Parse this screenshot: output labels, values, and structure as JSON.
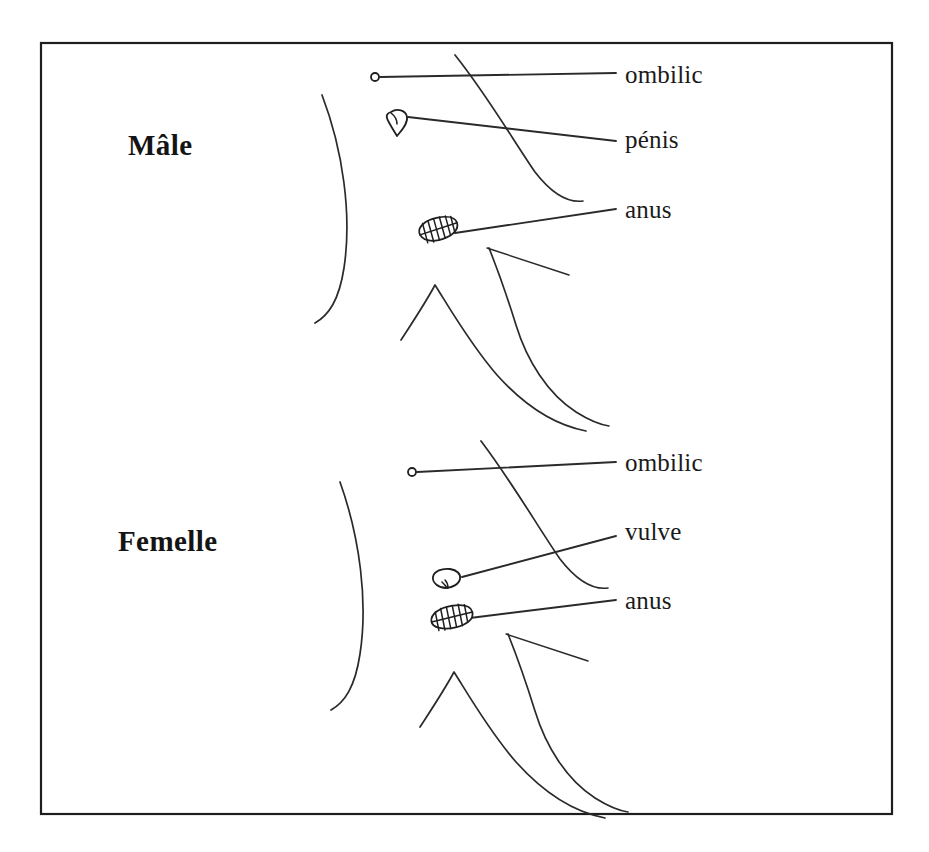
{
  "figure": {
    "kind": "anatomical-line-drawing",
    "language": "fr",
    "background_color": "#ffffff",
    "ink_color": "#2a2a2a",
    "frame": {
      "name": "figure-border",
      "x": 40,
      "y": 42,
      "width": 853,
      "height": 773,
      "stroke_color": "#1e1e1e"
    }
  },
  "panels": [
    {
      "id": "male",
      "title": "Mâle",
      "title_x": 128,
      "title_y": 131,
      "navel_marker": {
        "cx": 375,
        "cy": 77,
        "r": 4
      },
      "labels": [
        {
          "id": "male-ombilic",
          "text": "ombilic",
          "x": 625,
          "y": 62,
          "leader": [
            [
              380,
              77
            ],
            [
              616,
              73
            ]
          ]
        },
        {
          "id": "male-penis",
          "text": "pénis",
          "x": 625,
          "y": 127,
          "leader": [
            [
              408,
              117
            ],
            [
              616,
              141
            ]
          ]
        },
        {
          "id": "male-anus",
          "text": "anus",
          "x": 625,
          "y": 197,
          "leader": [
            [
              455,
              233
            ],
            [
              616,
              209
            ]
          ]
        }
      ],
      "organs": [
        {
          "id": "male-penis-organ",
          "type": "penis",
          "cx": 399,
          "cy": 120
        },
        {
          "id": "male-anus-organ",
          "type": "anus",
          "cx": 438,
          "cy": 229
        }
      ]
    },
    {
      "id": "female",
      "title": "Femelle",
      "title_x": 118,
      "title_y": 527,
      "navel_marker": {
        "cx": 412,
        "cy": 472,
        "r": 4
      },
      "labels": [
        {
          "id": "female-ombilic",
          "text": "ombilic",
          "x": 625,
          "y": 450,
          "leader": [
            [
              417,
              472
            ],
            [
              616,
              462
            ]
          ]
        },
        {
          "id": "female-vulve",
          "text": "vulve",
          "x": 625,
          "y": 519,
          "leader": [
            [
              462,
              577
            ],
            [
              616,
              536
            ]
          ]
        },
        {
          "id": "female-anus",
          "text": "anus",
          "x": 625,
          "y": 588,
          "leader": [
            [
              470,
              618
            ],
            [
              616,
              600
            ]
          ]
        }
      ],
      "organs": [
        {
          "id": "female-vulve-organ",
          "type": "vulva",
          "cx": 446,
          "cy": 578
        },
        {
          "id": "female-anus-organ",
          "type": "anus",
          "cx": 452,
          "cy": 617
        }
      ]
    }
  ],
  "body_outlines": {
    "male": {
      "flank_left": "M 322 95 C 343 150, 352 215, 344 268 C 339 300, 329 315, 315 323",
      "flank_right": "M 455 55 C 487 95, 513 140, 535 172 C 552 194, 568 203, 583 201",
      "groin_left": "M 401 340 C 414 320, 426 302, 435 285 C 449 307, 470 344, 497 375 C 532 414, 565 427, 586 431",
      "groin_right": "M 489 248 C 497 268, 507 296, 516 325 C 527 361, 548 394, 576 412 C 592 422, 602 425, 609 426",
      "hock_tick": "M 487 248 L 569 275"
    },
    "female": {
      "flank_left": "M 340 482 C 360 538, 368 602, 360 654 C 355 687, 345 702, 331 710",
      "flank_right": "M 481 441 C 512 482, 538 527, 560 559 C 577 581, 593 590, 608 588",
      "groin_left": "M 420 727 C 433 707, 445 689, 454 672 C 468 694, 489 731, 516 762 C 551 801, 584 814, 605 818",
      "groin_right": "M 508 634 C 516 654, 526 682, 535 711 C 546 747, 567 780, 595 798 C 611 808, 621 811, 628 812",
      "hock_tick": "M 506 634 L 588 661"
    }
  }
}
